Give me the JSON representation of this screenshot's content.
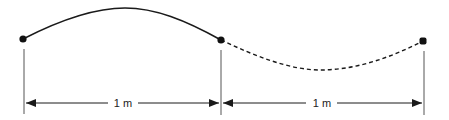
{
  "diagram": {
    "type": "wave-segments",
    "points": [
      {
        "id": "left-node",
        "x": 23,
        "y": 39
      },
      {
        "id": "middle-node",
        "x": 221,
        "y": 40
      },
      {
        "id": "right-node",
        "x": 423,
        "y": 41
      }
    ],
    "curves": [
      {
        "id": "crest",
        "style": "solid",
        "from": "left-node",
        "to": "middle-node"
      },
      {
        "id": "trough",
        "style": "dashed",
        "from": "middle-node",
        "to": "right-node"
      }
    ],
    "dimensions": [
      {
        "id": "dim-left",
        "label": "1 m"
      },
      {
        "id": "dim-right",
        "label": "1 m"
      }
    ],
    "colors": {
      "line": "#1a1a1a",
      "guide": "#555555",
      "background": "#ffffff"
    }
  }
}
